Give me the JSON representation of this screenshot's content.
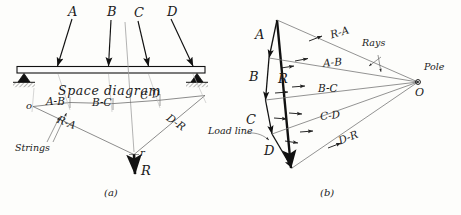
{
  "figure": {
    "type": "graphic-statics-funicular-polygon",
    "captions": {
      "left": "(a)",
      "right": "(b)"
    },
    "space_diagram": {
      "title": "Space diagram",
      "beam": {
        "left_support": "hinge",
        "right_support": "hinge"
      },
      "loads": [
        {
          "label": "A",
          "direction": "down-left"
        },
        {
          "label": "B",
          "direction": "down"
        },
        {
          "label": "C",
          "direction": "down-right"
        },
        {
          "label": "D",
          "direction": "down-right"
        }
      ],
      "funicular": {
        "start_point": "o",
        "closing_point": "r",
        "strings_label": "Strings",
        "string_labels": [
          "R-A",
          "A-B",
          "B-C",
          "C-D",
          "D-R"
        ],
        "resultant_label": "R"
      }
    },
    "force_polygon": {
      "load_line_label": "Load line",
      "rays_label": "Rays",
      "pole_label": "Pole",
      "pole_letter": "O",
      "load_vectors": [
        "A",
        "B",
        "C",
        "D"
      ],
      "resultant_label": "R",
      "ray_labels": [
        "R-A",
        "A-B",
        "B-C",
        "C-D",
        "D-R"
      ]
    }
  }
}
